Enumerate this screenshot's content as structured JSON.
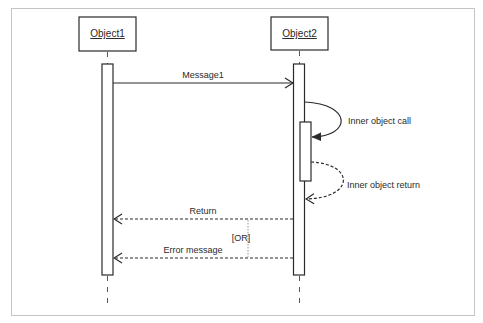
{
  "diagram": {
    "type": "UML sequence diagram",
    "objects": [
      {
        "id": "obj1",
        "label": "Object1"
      },
      {
        "id": "obj2",
        "label": "Object2"
      }
    ],
    "messages": [
      {
        "from": "obj1",
        "to": "obj2",
        "label": "Message1",
        "style": "solid",
        "arrowhead": "open"
      },
      {
        "from": "obj2",
        "to": "obj2",
        "label": "Inner object call",
        "style": "solid",
        "arrowhead": "filled"
      },
      {
        "from": "obj2",
        "to": "obj2",
        "label": "Inner object return",
        "style": "dashed",
        "arrowhead": "open"
      },
      {
        "from": "obj2",
        "to": "obj1",
        "label": "Return",
        "style": "dashed",
        "arrowhead": "open"
      },
      {
        "from": "obj2",
        "to": "obj1",
        "label": "Error message",
        "style": "dashed",
        "arrowhead": "open"
      }
    ],
    "alternative_label": "[OR]",
    "colors": {
      "line": "#2a2a2a",
      "frame": "#c4c4c4",
      "background": "#ffffff"
    }
  }
}
